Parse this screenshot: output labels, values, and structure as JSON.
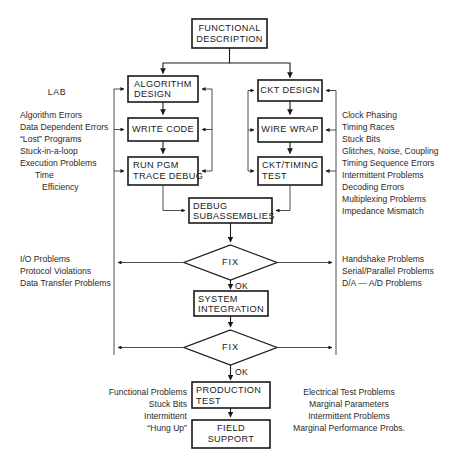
{
  "diagram": {
    "nodes": {
      "functional_description": "FUNCTIONAL\nDESCRIPTION",
      "functional_description_line1": "FUNCTIONAL",
      "functional_description_line2": "DESCRIPTION",
      "algorithm_design_line1": "ALGORITHM",
      "algorithm_design_line2": "DESIGN",
      "write_code": "WRITE CODE",
      "run_pgm_line1": "RUN PGM",
      "run_pgm_line2": "TRACE DEBUG",
      "ckt_design": "CKT DESIGN",
      "wire_wrap": "WIRE WRAP",
      "ckt_timing_line1": "CKT/TIMING",
      "ckt_timing_line2": "TEST",
      "debug_sub_line1": "DEBUG",
      "debug_sub_line2": "SUBASSEMBLIES",
      "fix_1": "FIX",
      "system_integration_line1": "SYSTEM",
      "system_integration_line2": "INTEGRATION",
      "fix_2": "FIX",
      "production_test_line1": "PRODUCTION",
      "production_test_line2": "TEST",
      "field_support_line1": "FIELD",
      "field_support_line2": "SUPPORT"
    },
    "edge_labels": {
      "ok_1": "OK",
      "ok_2": "OK"
    },
    "annotations": {
      "lab_heading": "LAB",
      "software_problems": [
        "Algorithm Errors",
        "Data Dependent Errors",
        "“Lost” Programs",
        "Stuck-in-a-loop",
        "Execution Problems",
        "Time",
        "Efficiency"
      ],
      "hardware_problems": [
        "Clock Phasing",
        "Timing Races",
        "Stuck Bits",
        "Glitches, Noise, Coupling",
        "Timing Sequence Errors",
        "Intermittent Problems",
        "Decoding Errors",
        "Multiplexing Problems",
        "Impedance Mismatch"
      ],
      "integration_left": [
        "I/O Problems",
        "Protocol Violations",
        "Data Transfer Problems"
      ],
      "integration_right": [
        "Handshake Problems",
        "Serial/Parallel Problems",
        "D/A — A/D Problems"
      ],
      "production_left": [
        "Functional Problems",
        "Stuck Bits",
        "Intermittent",
        "“Hung Up”"
      ],
      "production_right": [
        "Electrical Test Problems",
        "Marginal Parameters",
        "Intermittent Problems",
        "Marginal Performance Probs."
      ]
    },
    "colors": {
      "ink": "#1a1a1a",
      "paper": "#ffffff",
      "line": "#3a3a3a"
    }
  }
}
